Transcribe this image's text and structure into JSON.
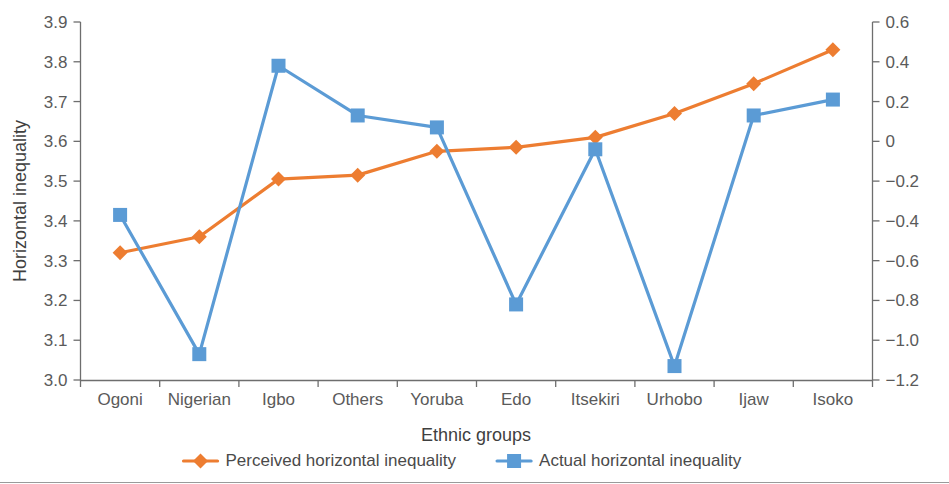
{
  "chart_data": {
    "type": "line",
    "title": "",
    "xlabel": "Ethnic groups",
    "ylabel": "Horizontal inequality",
    "y2label": "",
    "categories": [
      "Ogoni",
      "Nigerian",
      "Igbo",
      "Others",
      "Yoruba",
      "Edo",
      "Itsekiri",
      "Urhobo",
      "Ijaw",
      "Isoko"
    ],
    "ylim": [
      3.0,
      3.9
    ],
    "y2lim": [
      -1.2,
      0.6
    ],
    "yticks": [
      "3.0",
      "3.1",
      "3.2",
      "3.3",
      "3.4",
      "3.5",
      "3.6",
      "3.7",
      "3.8",
      "3.9"
    ],
    "ytick_values": [
      3.0,
      3.1,
      3.2,
      3.3,
      3.4,
      3.5,
      3.6,
      3.7,
      3.8,
      3.9
    ],
    "y2ticks": [
      "−1.2",
      "−1.0",
      "−0.8",
      "−0.6",
      "−0.4",
      "−0.2",
      "0",
      "0.2",
      "0.4",
      "0.6"
    ],
    "y2tick_values": [
      -1.2,
      -1.0,
      -0.8,
      -0.6,
      -0.4,
      -0.2,
      0,
      0.2,
      0.4,
      0.6
    ],
    "grid": false,
    "legend_position": "bottom",
    "series": [
      {
        "name": "Perceived horizontal inequality",
        "axis": "left",
        "color": "#ed7d31",
        "marker": "diamond",
        "values": [
          3.32,
          3.36,
          3.505,
          3.515,
          3.575,
          3.585,
          3.61,
          3.67,
          3.745,
          3.83
        ]
      },
      {
        "name": "Actual horizontal inequality",
        "axis": "right",
        "color": "#5b9bd5",
        "marker": "square",
        "values": [
          -0.37,
          -1.07,
          0.38,
          0.13,
          0.07,
          -0.82,
          -0.04,
          -1.13,
          0.13,
          0.21
        ]
      }
    ]
  },
  "legend": {
    "items": [
      {
        "label": "Perceived horizontal inequality",
        "color": "#ed7d31",
        "marker": "diamond"
      },
      {
        "label": "Actual horizontal inequality",
        "color": "#5b9bd5",
        "marker": "square"
      }
    ]
  }
}
